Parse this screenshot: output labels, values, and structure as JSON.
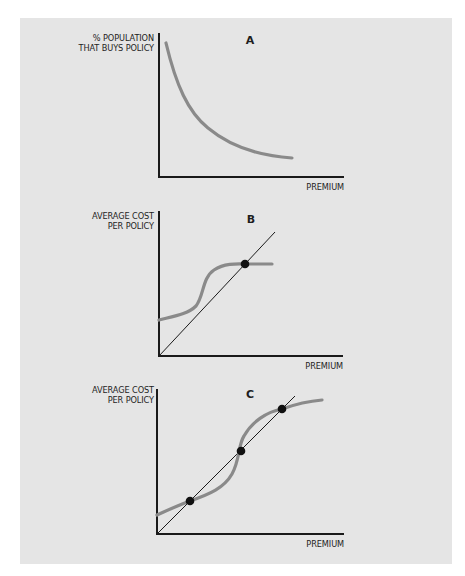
{
  "figure": {
    "panels": [
      {
        "id": "A",
        "title": "A",
        "y_label_lines": [
          "% POPULATION",
          "THAT BUYS POLICY"
        ],
        "x_label": "PREMIUM",
        "curve_description": "decreasing convex demand curve",
        "has_diagonal": false,
        "equilibrium_points": 0
      },
      {
        "id": "B",
        "title": "B",
        "y_label_lines": [
          "AVERAGE COST",
          "PER POLICY"
        ],
        "x_label": "PREMIUM",
        "curve_description": "S-shaped average cost curve crossing 45-degree line once",
        "has_diagonal": true,
        "equilibrium_points": 1
      },
      {
        "id": "C",
        "title": "C",
        "y_label_lines": [
          "AVERAGE COST",
          "PER POLICY"
        ],
        "x_label": "PREMIUM",
        "curve_description": "S-shaped average cost curve crossing 45-degree line three times",
        "has_diagonal": true,
        "equilibrium_points": 3
      }
    ],
    "colors": {
      "panel_background": "#e5e5e5",
      "curve": "#8a8a8a",
      "axis": "#1a1a1a",
      "text": "#1e1e1e"
    }
  }
}
